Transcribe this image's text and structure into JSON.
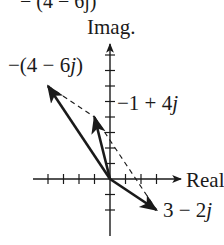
{
  "axes": {
    "x_label": "Real",
    "y_label": "Imag.",
    "origin_px": [
      110,
      179
    ],
    "tick_spacing_px": 15.5,
    "x_ticks": [
      -4,
      -3,
      -2,
      -1,
      1,
      2,
      3
    ],
    "y_ticks": [
      -1,
      -2,
      1,
      2,
      3,
      4,
      5,
      6,
      7,
      8
    ]
  },
  "top_fragment": "− (4 − 6j)",
  "vectors": [
    {
      "id": "v1",
      "label_prefix": "−(4 − 6",
      "label_j": "j",
      "label_suffix": ")",
      "re": -4,
      "im": 6,
      "style": "solid"
    },
    {
      "id": "v2",
      "label_prefix": "−1 + 4",
      "label_j": "j",
      "label_suffix": "",
      "re": -1,
      "im": 4,
      "style": "solid"
    },
    {
      "id": "v3",
      "label_prefix": "3 − 2",
      "label_j": "j",
      "label_suffix": "",
      "re": 3,
      "im": -2,
      "style": "solid"
    }
  ],
  "dashed_lines": [
    {
      "from": [
        -4,
        6
      ],
      "to": [
        -1,
        4
      ]
    },
    {
      "from": [
        -1,
        4
      ],
      "to": [
        3,
        -2
      ]
    }
  ],
  "colors": {
    "ink": "#1a1a1a",
    "background": "#ffffff"
  }
}
